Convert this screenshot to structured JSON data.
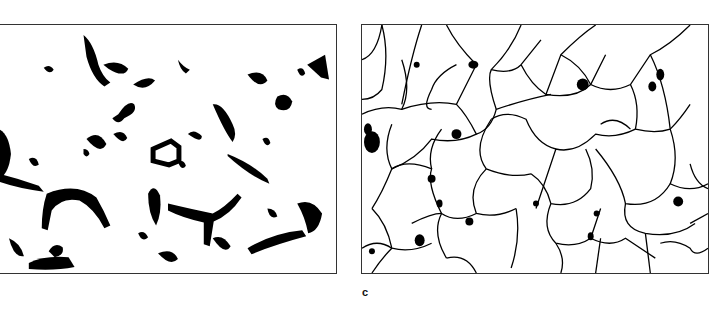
{
  "figure": {
    "panels": [
      {
        "id": "left",
        "description": "Binarized micrograph showing dark particle clusters along network boundaries",
        "label": ""
      },
      {
        "id": "right",
        "description": "Grain boundary tracing showing polygonal grain network with dark inclusions",
        "label": "c"
      }
    ],
    "label_c": "c",
    "colors": {
      "ink": "#000000",
      "background": "#ffffff",
      "frame": "#333333"
    }
  }
}
